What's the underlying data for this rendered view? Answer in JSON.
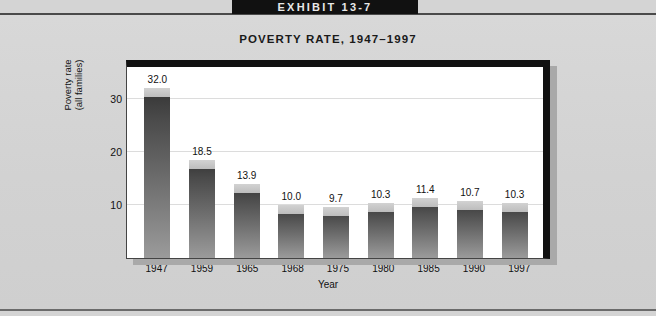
{
  "exhibit": {
    "label": "EXHIBIT 13-7"
  },
  "chart_data": {
    "type": "bar",
    "title": "POVERTY RATE, 1947–1997",
    "xlabel": "Year",
    "ylabel": "Poverty rate\n(all families)",
    "ylabel_line1": "Poverty rate",
    "ylabel_line2": "(all families)",
    "categories": [
      "1947",
      "1959",
      "1965",
      "1968",
      "1975",
      "1980",
      "1985",
      "1990",
      "1997"
    ],
    "values": [
      32.0,
      18.5,
      13.9,
      10.0,
      9.7,
      10.3,
      11.4,
      10.7,
      10.3
    ],
    "value_labels": [
      "32.0",
      "18.5",
      "13.9",
      "10.0",
      "9.7",
      "10.3",
      "11.4",
      "10.7",
      "10.3"
    ],
    "ylim": [
      0,
      36
    ],
    "yticks": [
      10,
      20,
      30
    ],
    "ytick_labels": [
      "10",
      "20",
      "30"
    ],
    "grid": true,
    "legend": null,
    "series": [
      {
        "name": "Poverty rate (all families)",
        "values": [
          32.0,
          18.5,
          13.9,
          10.0,
          9.7,
          10.3,
          11.4,
          10.7,
          10.3
        ]
      }
    ]
  },
  "colors": {
    "page_background": "#d4d4d4",
    "banner_background": "#111111",
    "banner_text": "#e8e8e8",
    "plot_background": "#ffffff",
    "frame": "#111111",
    "shadow": "#a9a9a9",
    "bar_top": "#343434",
    "bar_bottom": "#9b9b9b",
    "bar_cap": "#c9c9c9",
    "gridline": "#dcdcdc",
    "text": "#111111"
  }
}
